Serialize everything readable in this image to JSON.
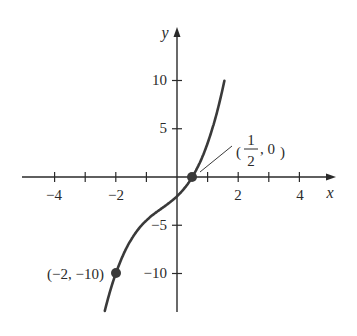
{
  "chart_data": {
    "type": "line",
    "title": "",
    "xlabel": "x",
    "ylabel": "y",
    "xlim": [
      -5,
      5
    ],
    "ylim": [
      -14,
      15
    ],
    "grid": false,
    "x_ticks": [
      -4,
      -3,
      -2,
      -1,
      1,
      2,
      3,
      4
    ],
    "x_tick_labels": [
      "-4",
      "-2",
      "2",
      "4"
    ],
    "x_tick_label_values": [
      -4,
      -2,
      2,
      4
    ],
    "y_ticks": [
      10,
      5,
      -5,
      -10
    ],
    "y_tick_labels": [
      "10",
      "5",
      "−5",
      "−10"
    ],
    "series": [
      {
        "name": "f(x)",
        "approx_function": "x^3 + 1.5x^2 + 3x - 2",
        "x_range": [
          -2.4,
          1.55
        ],
        "color": "#3a3a3a"
      }
    ],
    "points": [
      {
        "x": 0.5,
        "y": 0,
        "label_num": "1",
        "label_den": "2",
        "label_rest": ", 0"
      },
      {
        "x": -2,
        "y": -10,
        "label": "(−2, −10)"
      }
    ],
    "annotations": [
      "(1/2, 0)",
      "(−2, −10)"
    ]
  },
  "labels": {
    "x_axis": "x",
    "y_axis": "y",
    "x_tick_neg4": "−4",
    "x_tick_neg2": "−2",
    "x_tick_2": "2",
    "x_tick_4": "4",
    "y_tick_10": "10",
    "y_tick_5": "5",
    "y_tick_neg5": "−5",
    "y_tick_neg10": "−10",
    "point_a_num": "1",
    "point_a_den": "2",
    "point_a_rest": ", 0",
    "point_b": "(−2, −10)"
  }
}
